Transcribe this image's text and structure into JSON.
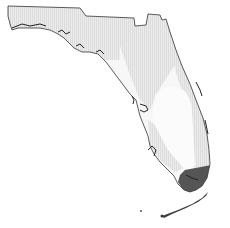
{
  "map": {
    "region": "Florida",
    "colors": {
      "background": "#ffffff",
      "state_fill": "#f7f7f7",
      "light_region": "#e4e4e4",
      "dark_region": "#555555",
      "outline": "#333333"
    },
    "zones": [
      {
        "name": "panhandle-west",
        "shade": "light"
      },
      {
        "name": "north-central-band",
        "shade": "light"
      },
      {
        "name": "east-coast-band",
        "shade": "light"
      },
      {
        "name": "central-interior",
        "shade": "none"
      },
      {
        "name": "southern-tip",
        "shade": "dark"
      },
      {
        "name": "florida-keys",
        "shade": "dark"
      }
    ]
  }
}
